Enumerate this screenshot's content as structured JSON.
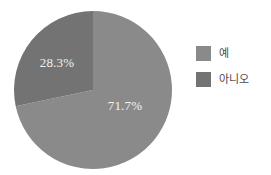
{
  "chart_data": {
    "type": "pie",
    "title": "",
    "subtitle": "",
    "xlabel": "",
    "ylabel": "",
    "categories": [
      "예",
      "아니오"
    ],
    "values": [
      71.7,
      28.3
    ],
    "slices": [
      {
        "label": "예",
        "value": 71.7,
        "display": "71.7%",
        "color": "#8a8a8a",
        "start_angle_deg": 0,
        "end_angle_deg": 258.12,
        "label_x": 125,
        "label_y": 107
      },
      {
        "label": "아니오",
        "value": 28.3,
        "display": "28.3%",
        "color": "#737373",
        "start_angle_deg": 258.12,
        "end_angle_deg": 360,
        "label_x": 57,
        "label_y": 64
      }
    ],
    "legend": {
      "position": "right",
      "entries": [
        {
          "label": "예",
          "color": "#8a8a8a"
        },
        {
          "label": "아니오",
          "color": "#737373"
        }
      ]
    },
    "grid": false,
    "background": "#ffffff",
    "label_color": "#f2f2f2",
    "geometry": {
      "center_x": 93,
      "center_y": 90,
      "radius": 79,
      "start_at_twelve_oclock": true,
      "direction": "clockwise"
    }
  }
}
